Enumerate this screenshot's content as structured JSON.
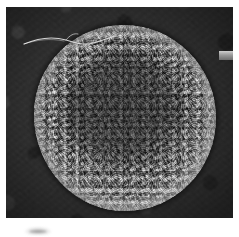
{
  "figure": {
    "type": "scanning-electron-micrograph",
    "title": "",
    "caption": "",
    "background_color": "#ffffff"
  },
  "plate": {
    "label": "electron micrograph plate",
    "background_color": "#2e2e2e",
    "border_color": "#ffffff"
  },
  "specimen": {
    "label": "spherical cell",
    "shape": "sphere",
    "surface": "granular rough",
    "highlight_color": "#c9c9c9",
    "core_color": "#4a4a4a"
  },
  "filament": {
    "label": "flagellum filament",
    "color": "#d8d8d8"
  },
  "edge_tab": {
    "label": "gray marker tab",
    "color": "#9a9a9a"
  },
  "caption_mark": {
    "label": "cropped caption mark",
    "text": ""
  }
}
